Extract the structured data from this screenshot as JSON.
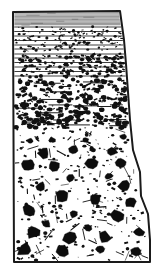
{
  "figure": {
    "domain": "Diagram",
    "kind": "stratigraphic-column",
    "title": "",
    "caption": "",
    "background_color": "#ffffff",
    "ink_color": "#111111",
    "canvas": {
      "width": 158,
      "height": 271
    }
  },
  "outline": {
    "name": "column-outline",
    "stroke_color": "#1a1a1a",
    "stroke_width": 2.0,
    "fill_color": "#ffffff",
    "points": [
      [
        13,
        12
      ],
      [
        120,
        11
      ],
      [
        124,
        40
      ],
      [
        126,
        64
      ],
      [
        128,
        92
      ],
      [
        130,
        120
      ],
      [
        133,
        150
      ],
      [
        140,
        172
      ],
      [
        141,
        196
      ],
      [
        148,
        214
      ],
      [
        150,
        240
      ],
      [
        150,
        262
      ],
      [
        14,
        262
      ]
    ]
  },
  "units": [
    {
      "id": "unit-1-laminated-mudstone",
      "label": "finely laminated mudstone",
      "pattern": "horizontal-laminae",
      "top_y": 12,
      "bottom_y": 25,
      "lamina_count": 13,
      "lamina_spacing_px": 1.0,
      "lamina_stroke_width": 0.55,
      "lamina_opacity": 0.78,
      "grain_density": 0
    },
    {
      "id": "unit-2-bedded-granule-sandstone",
      "label": "bedded granule sandstone",
      "pattern": "bedded-granules",
      "top_y": 25,
      "bottom_y": 52,
      "bed_boundaries_y": [
        27,
        31.5,
        36,
        40.5,
        45,
        49
      ],
      "bed_stroke_width": 0.9,
      "grain_density": 150,
      "grain_min_px": 0.7,
      "grain_max_px": 1.7
    },
    {
      "id": "unit-3-coarse-granule-beds",
      "label": "coarse granule beds",
      "pattern": "bedded-granules-coarse",
      "top_y": 52,
      "bottom_y": 78,
      "bed_boundaries_y": [
        54,
        58,
        62.5,
        67,
        71.5,
        76
      ],
      "bed_stroke_width": 0.9,
      "grain_density": 160,
      "grain_min_px": 0.9,
      "grain_max_px": 2.4
    },
    {
      "id": "unit-4-pebbly-transition",
      "label": "pebbly transitional sandstone with discontinuous laminae",
      "pattern": "scattered-grains-with-short-laminae",
      "top_y": 78,
      "bottom_y": 128,
      "grain_density": 320,
      "grain_min_px": 0.8,
      "grain_max_px": 3.0,
      "short_lamina_count": 22,
      "short_lamina_len_min": 8,
      "short_lamina_len_max": 26
    },
    {
      "id": "unit-5-matrix-supported-breccia",
      "label": "massive matrix-supported breccia / diamictite",
      "pattern": "angular-clasts-in-speckled-matrix",
      "top_y": 128,
      "bottom_y": 262,
      "matrix_dot_density": 230,
      "matrix_dot_min_px": 0.6,
      "matrix_dot_max_px": 2.2,
      "flake_count": 70,
      "flake_len_min": 3,
      "flake_len_max": 11,
      "clast_count": 31,
      "clast_color": "#0d0d0d"
    }
  ],
  "clasts": [
    {
      "cx": 44,
      "cy": 153,
      "r": 6.0,
      "rot": 18
    },
    {
      "cx": 74,
      "cy": 150,
      "r": 5.3,
      "rot": 62
    },
    {
      "cx": 112,
      "cy": 152,
      "r": 5.0,
      "rot": 110
    },
    {
      "cx": 27,
      "cy": 165,
      "r": 7.4,
      "rot": 35
    },
    {
      "cx": 54,
      "cy": 166,
      "r": 5.6,
      "rot": 150
    },
    {
      "cx": 92,
      "cy": 164,
      "r": 6.5,
      "rot": 80
    },
    {
      "cx": 121,
      "cy": 163,
      "r": 5.4,
      "rot": 25
    },
    {
      "cx": 70,
      "cy": 178,
      "r": 4.2,
      "rot": 200
    },
    {
      "cx": 41,
      "cy": 186,
      "r": 5.1,
      "rot": 12
    },
    {
      "cx": 124,
      "cy": 186,
      "r": 6.8,
      "rot": 95
    },
    {
      "cx": 62,
      "cy": 196,
      "r": 7.0,
      "rot": 48
    },
    {
      "cx": 95,
      "cy": 199,
      "r": 6.0,
      "rot": 170
    },
    {
      "cx": 29,
      "cy": 210,
      "r": 6.6,
      "rot": 130
    },
    {
      "cx": 131,
      "cy": 203,
      "r": 5.7,
      "rot": 60
    },
    {
      "cx": 74,
      "cy": 214,
      "r": 4.8,
      "rot": 22
    },
    {
      "cx": 118,
      "cy": 216,
      "r": 7.2,
      "rot": 88
    },
    {
      "cx": 46,
      "cy": 224,
      "r": 4.4,
      "rot": 145
    },
    {
      "cx": 88,
      "cy": 228,
      "r": 5.0,
      "rot": 70
    },
    {
      "cx": 33,
      "cy": 232,
      "r": 7.6,
      "rot": 30
    },
    {
      "cx": 71,
      "cy": 237,
      "r": 8.2,
      "rot": 105
    },
    {
      "cx": 105,
      "cy": 237,
      "r": 6.2,
      "rot": 15
    },
    {
      "cx": 139,
      "cy": 232,
      "r": 5.2,
      "rot": 180
    },
    {
      "cx": 25,
      "cy": 250,
      "r": 7.8,
      "rot": 55
    },
    {
      "cx": 63,
      "cy": 252,
      "r": 7.1,
      "rot": 128
    },
    {
      "cx": 100,
      "cy": 249,
      "r": 4.9,
      "rot": 40
    },
    {
      "cx": 136,
      "cy": 251,
      "r": 5.4,
      "rot": 92
    },
    {
      "cx": 109,
      "cy": 176,
      "r": 3.8,
      "rot": 160
    },
    {
      "cx": 52,
      "cy": 140,
      "r": 3.4,
      "rot": 75
    },
    {
      "cx": 86,
      "cy": 140,
      "r": 3.1,
      "rot": 20
    },
    {
      "cx": 123,
      "cy": 137,
      "r": 3.6,
      "rot": 115
    },
    {
      "cx": 30,
      "cy": 141,
      "r": 2.9,
      "rot": 50
    }
  ]
}
